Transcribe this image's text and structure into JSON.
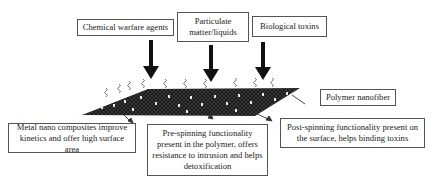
{
  "diagram": {
    "top_labels": [
      {
        "id": "cwa",
        "text": "Chemical warfare agents"
      },
      {
        "id": "particulate",
        "text": "Particulate matter/liquids"
      },
      {
        "id": "bio",
        "text": "Biological toxins"
      }
    ],
    "side_label": {
      "id": "nanofiber",
      "text": "Polymer nanofiber"
    },
    "bottom_labels": [
      {
        "id": "metal",
        "text": "Metal nano composites improve kinetics and offer high surface area"
      },
      {
        "id": "pre",
        "text": "Pre-spinning functionality present in the polymer, offers resistance to intrusion and helps detoxification"
      },
      {
        "id": "post",
        "text": "Post-spinning functionality present on the surface, helps binding toxins"
      }
    ],
    "colors": {
      "mesh": "#1a1a1a",
      "dots": "#e8e8e8",
      "arrow": "#111111",
      "border": "#555555"
    }
  }
}
